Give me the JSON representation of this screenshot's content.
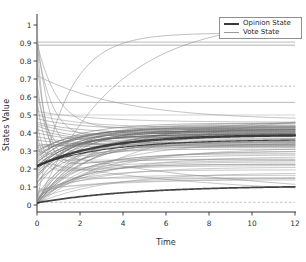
{
  "figure": {
    "xlabel": "Time",
    "ylabel": "States Value",
    "background": "#ffffff",
    "axis_color": "#333333",
    "tick_label_color": "#2e2e2e"
  },
  "legend": {
    "position": "top-right",
    "border_color": "#8f8f8f",
    "items": [
      {
        "label": "Opinion State",
        "color": "#3a3a3a",
        "thickness": 2.4
      },
      {
        "label": "Vote State",
        "color": "#9a9a9a",
        "thickness": 1.3
      }
    ]
  },
  "chart_data": {
    "type": "line",
    "title": "",
    "xlabel": "Time",
    "ylabel": "States Value",
    "xlim": [
      0,
      12
    ],
    "ylim": [
      -0.04,
      1.06
    ],
    "grid": false,
    "legend_position": "top-right",
    "x_ticks": [
      0,
      2,
      4,
      6,
      8,
      10,
      12
    ],
    "x_tick_labels": [
      "0",
      "2",
      "4",
      "6",
      "8",
      "10",
      "12"
    ],
    "y_ticks": [
      0,
      0.1,
      0.2,
      0.3,
      0.4,
      0.5,
      0.6,
      0.7,
      0.8,
      0.9,
      1
    ],
    "y_tick_labels": [
      "0",
      "0.1",
      "0.2",
      "0.3",
      "0.4",
      "0.5",
      "0.6",
      "0.7",
      "0.8",
      "0.9",
      "1"
    ],
    "palette": [
      "#c0c0c0",
      "#a9a9a9",
      "#8f8f8f",
      "#767676",
      "#575757",
      "#303030"
    ],
    "series_note": "opinion_curves model: value(t)=end+(start-end-p2)*exp(-a*t)+p2*exp(-b*t); entries are [start,end,a,p2,b,colorIndex,width]",
    "vote_lines": [
      {
        "v": 0.905,
        "x0": 0,
        "x1": 12,
        "cls": 1,
        "w": 0.8,
        "dash": null
      },
      {
        "v": 0.888,
        "x0": 0,
        "x1": 12,
        "cls": 2,
        "w": 0.7,
        "dash": null
      },
      {
        "v": 0.66,
        "x0": 2.3,
        "x1": 12,
        "cls": 1,
        "w": 0.8,
        "dash": "2.5,2"
      },
      {
        "v": 0.57,
        "x0": 0,
        "x1": 12,
        "cls": 1,
        "w": 0.8,
        "dash": null
      },
      {
        "v": 0.5,
        "x0": 0,
        "x1": 12,
        "cls": 0,
        "w": 0.7,
        "dash": null
      },
      {
        "v": 0.25,
        "x0": 0,
        "x1": 12,
        "cls": 0,
        "w": 0.7,
        "dash": null
      },
      {
        "v": 0.15,
        "x0": 0,
        "x1": 12,
        "cls": 1,
        "w": 0.7,
        "dash": null
      },
      {
        "v": 0.015,
        "x0": 0,
        "x1": 12,
        "cls": 1,
        "w": 0.7,
        "dash": "2.5,2"
      }
    ],
    "opinion_curves": [
      [
        0.0,
        0.52,
        0.18,
        0,
        0,
        2,
        0.55
      ],
      [
        0.01,
        0.47,
        0.3,
        0,
        0,
        3,
        0.55
      ],
      [
        0.02,
        0.44,
        0.38,
        0,
        0,
        2,
        0.55
      ],
      [
        0.0,
        0.42,
        0.45,
        0,
        0,
        3,
        0.55
      ],
      [
        0.01,
        0.4,
        0.55,
        0,
        0,
        2,
        0.55
      ],
      [
        0.02,
        0.385,
        0.62,
        0,
        0,
        3,
        0.55
      ],
      [
        0.03,
        0.37,
        0.42,
        0,
        0,
        2,
        0.55
      ],
      [
        0.0,
        0.355,
        0.5,
        0,
        0,
        3,
        0.55
      ],
      [
        0.01,
        0.345,
        0.35,
        0,
        0,
        2,
        0.55
      ],
      [
        0.02,
        0.335,
        0.65,
        0,
        0,
        3,
        0.55
      ],
      [
        0.04,
        0.32,
        0.28,
        0,
        0,
        2,
        0.55
      ],
      [
        0.05,
        0.31,
        0.75,
        0,
        0,
        3,
        0.55
      ],
      [
        0.0,
        0.3,
        0.4,
        0,
        0,
        2,
        0.55
      ],
      [
        0.01,
        0.285,
        0.55,
        0,
        0,
        3,
        0.55
      ],
      [
        0.03,
        0.27,
        0.33,
        0,
        0,
        2,
        0.55
      ],
      [
        0.02,
        0.255,
        0.7,
        0,
        0,
        3,
        0.55
      ],
      [
        0.04,
        0.24,
        0.45,
        0,
        0,
        2,
        0.55
      ],
      [
        0.0,
        0.225,
        0.6,
        0,
        0,
        3,
        0.55
      ],
      [
        0.05,
        0.21,
        0.38,
        0,
        0,
        2,
        0.55
      ],
      [
        0.06,
        0.195,
        0.52,
        0,
        0,
        2,
        0.55
      ],
      [
        0.01,
        0.18,
        0.3,
        0,
        0,
        2,
        0.55
      ],
      [
        0.07,
        0.165,
        0.58,
        0,
        0,
        2,
        0.55
      ],
      [
        0.03,
        0.15,
        0.44,
        0,
        0,
        2,
        0.55
      ],
      [
        0.08,
        0.14,
        0.36,
        0,
        0,
        2,
        0.55
      ],
      [
        0.09,
        0.16,
        0.15,
        0,
        0,
        1,
        0.55
      ],
      [
        0.1,
        0.43,
        0.5,
        0,
        0,
        3,
        0.6
      ],
      [
        0.12,
        0.415,
        0.6,
        0,
        0,
        4,
        0.6
      ],
      [
        0.13,
        0.4,
        0.4,
        0,
        0,
        3,
        0.6
      ],
      [
        0.15,
        0.435,
        0.55,
        0,
        0,
        4,
        0.6
      ],
      [
        0.16,
        0.39,
        0.7,
        0,
        0,
        4,
        0.6
      ],
      [
        0.17,
        0.42,
        0.45,
        0,
        0,
        3,
        0.6
      ],
      [
        0.18,
        0.405,
        0.6,
        0,
        0,
        4,
        0.6
      ],
      [
        0.19,
        0.38,
        0.8,
        0,
        0,
        4,
        0.6
      ],
      [
        0.2,
        0.44,
        0.5,
        0,
        0,
        3,
        0.6
      ],
      [
        0.21,
        0.41,
        0.65,
        0,
        0,
        4,
        0.6
      ],
      [
        0.22,
        0.395,
        0.55,
        0,
        0,
        4,
        0.6
      ],
      [
        0.23,
        0.425,
        0.7,
        0,
        0,
        3,
        0.6
      ],
      [
        0.24,
        0.39,
        0.6,
        0,
        0,
        4,
        0.6
      ],
      [
        0.25,
        0.445,
        0.48,
        0,
        0,
        3,
        0.6
      ],
      [
        0.26,
        0.41,
        0.75,
        0,
        0,
        4,
        0.6
      ],
      [
        0.27,
        0.43,
        0.55,
        0,
        0,
        3,
        0.6
      ],
      [
        0.28,
        0.4,
        0.65,
        0,
        0,
        4,
        0.6
      ],
      [
        0.29,
        0.455,
        0.5,
        0,
        0,
        3,
        0.6
      ],
      [
        0.3,
        0.42,
        0.6,
        0,
        0,
        4,
        0.6
      ],
      [
        0.46,
        0.4,
        0.55,
        0,
        0,
        3,
        0.55
      ],
      [
        0.45,
        0.37,
        0.45,
        0,
        0,
        3,
        0.55
      ],
      [
        0.44,
        0.36,
        0.6,
        0,
        0,
        3,
        0.55
      ],
      [
        0.42,
        0.345,
        0.5,
        0,
        0,
        3,
        0.55
      ],
      [
        0.4,
        0.335,
        0.4,
        0,
        0,
        3,
        0.55
      ],
      [
        0.38,
        0.33,
        0.55,
        0,
        0,
        3,
        0.55
      ],
      [
        0.36,
        0.325,
        0.45,
        0,
        0,
        3,
        0.55
      ],
      [
        0.34,
        0.32,
        0.6,
        0,
        0,
        3,
        0.55
      ],
      [
        0.33,
        0.35,
        0.35,
        0,
        0,
        3,
        0.55
      ],
      [
        0.32,
        0.34,
        0.5,
        0,
        0,
        3,
        0.55
      ],
      [
        0.5,
        0.43,
        0.45,
        0,
        0,
        2,
        0.55
      ],
      [
        0.52,
        0.46,
        0.35,
        0,
        0,
        2,
        0.55
      ],
      [
        0.48,
        0.42,
        0.5,
        0,
        0,
        3,
        0.55
      ],
      [
        0.95,
        0.4,
        1.6,
        -0.2,
        0.25,
        2,
        0.6
      ],
      [
        0.93,
        0.36,
        2.6,
        -0.2,
        0.3,
        2,
        0.6
      ],
      [
        0.88,
        0.44,
        1.2,
        -0.2,
        0.35,
        2,
        0.6
      ],
      [
        0.8,
        0.35,
        2.0,
        -0.2,
        0.4,
        2,
        0.6
      ],
      [
        0.72,
        0.47,
        0.25,
        0,
        0,
        2,
        0.6
      ],
      [
        0.68,
        0.3,
        1.8,
        -0.15,
        0.3,
        2,
        0.6
      ],
      [
        0.62,
        0.33,
        1.5,
        -0.12,
        0.35,
        2,
        0.6
      ],
      [
        0.58,
        0.28,
        2.2,
        -0.1,
        0.3,
        2,
        0.6
      ],
      [
        0.46,
        0.25,
        2.5,
        -0.08,
        0.28,
        2,
        0.55
      ],
      [
        0.4,
        0.23,
        2.8,
        -0.06,
        0.3,
        2,
        0.55
      ],
      [
        0.35,
        0.22,
        3.0,
        -0.05,
        0.3,
        2,
        0.55
      ],
      [
        0.9,
        0.46,
        0.9,
        -0.15,
        0.3,
        2,
        0.6
      ],
      [
        0.02,
        0.955,
        0.7,
        0,
        0,
        2,
        0.65
      ],
      [
        0.0,
        1.04,
        0.28,
        0,
        0,
        2,
        0.65
      ],
      [
        0.3,
        0.02,
        0.09,
        0,
        0,
        2,
        0.6
      ],
      [
        0.24,
        0.05,
        0.12,
        0,
        0,
        2,
        0.55
      ],
      [
        0.22,
        0.365,
        0.3,
        0,
        0,
        5,
        1.1
      ],
      [
        0.012,
        0.108,
        0.22,
        0,
        0,
        5,
        1.7
      ],
      [
        0.215,
        0.39,
        0.33,
        0,
        0,
        5,
        2.4
      ]
    ],
    "geometry": {
      "x0_px": 37,
      "x1_px": 295,
      "y0_px": 205,
      "y1_px": 25,
      "axis_bottom_px": 212,
      "axis_top_px": 14,
      "axis_right_px": 296
    }
  }
}
